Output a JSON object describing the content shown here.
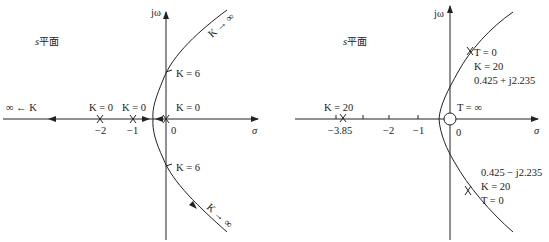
{
  "left_plot": {
    "plane_label_var": "s",
    "plane_label_text": "平面",
    "y_axis_label": "jω",
    "x_axis_label": "σ",
    "ticks": [
      {
        "value": -2,
        "label": "−2"
      },
      {
        "value": -1,
        "label": "−1"
      },
      {
        "value": 0,
        "label": "0"
      }
    ],
    "poles": [
      {
        "value": 0,
        "label": "K = 0"
      },
      {
        "value": -1,
        "label": "K = 0"
      },
      {
        "value": -2,
        "label": "K = 0"
      }
    ],
    "labels": {
      "infinity_left": "∞ ← K",
      "k0_a": "K = 0",
      "k0_b": "K = 0",
      "k0_c": "K = 0",
      "k6_upper": "K = 6",
      "k6_lower": "K = 6",
      "k_inf_upper": "K → ∞",
      "k_inf_lower": "K → ∞"
    }
  },
  "right_plot": {
    "plane_label_var": "s",
    "plane_label_text": "平面",
    "y_axis_label": "jω",
    "x_axis_label": "σ",
    "ticks": [
      {
        "value": -3.85,
        "label": "−3.85"
      },
      {
        "value": -2,
        "label": "−2"
      },
      {
        "value": -1,
        "label": "−1"
      },
      {
        "value": 0,
        "label": "0"
      }
    ],
    "labels": {
      "k20_real": "K = 20",
      "t_inf": "T = ∞",
      "upper_t0": "T = 0",
      "upper_k20": "K = 20",
      "upper_point": "0.425 + j2.235",
      "lower_point": "0.425 − j2.235",
      "lower_k20": "K = 20",
      "lower_t0": "T = 0"
    }
  },
  "colors": {
    "line": "#222222",
    "background": "#ffffff"
  }
}
